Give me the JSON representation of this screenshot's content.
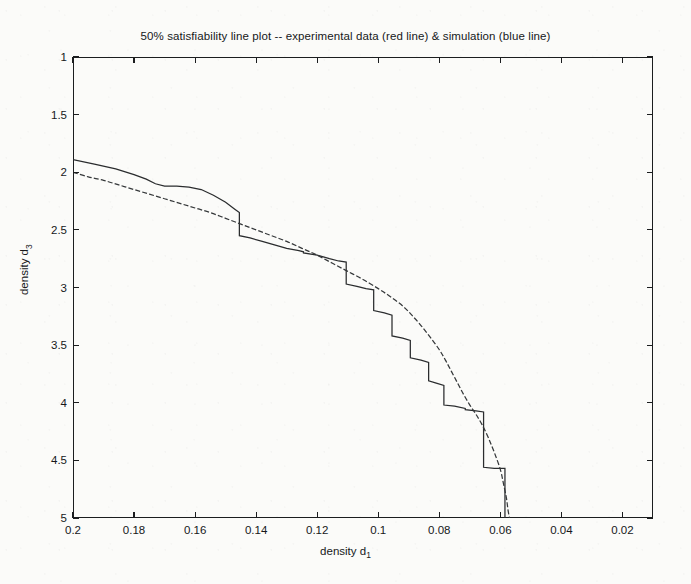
{
  "chart_data": {
    "type": "line",
    "title": "50% satisfiability line plot -- experimental data (red line) & simulation (blue line)",
    "xlabel": "density d",
    "xlabel_sub": "1",
    "ylabel": "density d",
    "ylabel_sub": "3",
    "xlim": [
      0.2,
      0.01
    ],
    "ylim": [
      5,
      1
    ],
    "x_inverted": true,
    "y_inverted": true,
    "grid": false,
    "legend_position": "none",
    "legend_in_title": true,
    "xticks": [
      0.2,
      0.18,
      0.16,
      0.14,
      0.12,
      0.1,
      0.08,
      0.06,
      0.04,
      0.02
    ],
    "xtick_labels": [
      "0.2",
      "0.18",
      "0.16",
      "0.14",
      "0.12",
      "0.1",
      "0.08",
      "0.06",
      "0.04",
      "0.02"
    ],
    "yticks": [
      1,
      1.5,
      2,
      2.5,
      3,
      3.5,
      4,
      4.5,
      5
    ],
    "ytick_labels": [
      "1",
      "1.5",
      "2",
      "2.5",
      "3",
      "3.5",
      "4",
      "4.5",
      "5"
    ],
    "series": [
      {
        "name": "experimental data (red line)",
        "style": "step",
        "color": "#2a2c2e",
        "points": [
          [
            0.2,
            1.89
          ],
          [
            0.193,
            1.93
          ],
          [
            0.186,
            1.97
          ],
          [
            0.18,
            2.02
          ],
          [
            0.176,
            2.06
          ],
          [
            0.173,
            2.1
          ],
          [
            0.17,
            2.12
          ],
          [
            0.166,
            2.12
          ],
          [
            0.162,
            2.13
          ],
          [
            0.158,
            2.15
          ],
          [
            0.154,
            2.2
          ],
          [
            0.15,
            2.26
          ],
          [
            0.147,
            2.32
          ],
          [
            0.1455,
            2.35
          ],
          [
            0.1455,
            2.55
          ],
          [
            0.142,
            2.57
          ],
          [
            0.138,
            2.6
          ],
          [
            0.134,
            2.63
          ],
          [
            0.13,
            2.66
          ],
          [
            0.126,
            2.68
          ],
          [
            0.1245,
            2.69
          ],
          [
            0.1245,
            2.7
          ],
          [
            0.12,
            2.72
          ],
          [
            0.116,
            2.75
          ],
          [
            0.113,
            2.77
          ],
          [
            0.1105,
            2.78
          ],
          [
            0.1105,
            2.97
          ],
          [
            0.107,
            2.99
          ],
          [
            0.104,
            3.01
          ],
          [
            0.1015,
            3.02
          ],
          [
            0.1015,
            3.2
          ],
          [
            0.098,
            3.22
          ],
          [
            0.0955,
            3.24
          ],
          [
            0.0955,
            3.42
          ],
          [
            0.092,
            3.44
          ],
          [
            0.0895,
            3.46
          ],
          [
            0.0895,
            3.61
          ],
          [
            0.086,
            3.63
          ],
          [
            0.0835,
            3.65
          ],
          [
            0.0835,
            3.81
          ],
          [
            0.081,
            3.83
          ],
          [
            0.0785,
            3.85
          ],
          [
            0.0785,
            4.02
          ],
          [
            0.075,
            4.03
          ],
          [
            0.0715,
            4.05
          ],
          [
            0.0715,
            4.06
          ],
          [
            0.068,
            4.07
          ],
          [
            0.0655,
            4.08
          ],
          [
            0.0655,
            4.56
          ],
          [
            0.062,
            4.57
          ],
          [
            0.0585,
            4.57
          ],
          [
            0.0585,
            5.0
          ]
        ]
      },
      {
        "name": "simulation (blue line)",
        "style": "smooth",
        "color": "#35383a",
        "points": [
          [
            0.2,
            2.0
          ],
          [
            0.195,
            2.04
          ],
          [
            0.19,
            2.07
          ],
          [
            0.185,
            2.11
          ],
          [
            0.18,
            2.15
          ],
          [
            0.175,
            2.19
          ],
          [
            0.17,
            2.23
          ],
          [
            0.165,
            2.27
          ],
          [
            0.16,
            2.31
          ],
          [
            0.155,
            2.35
          ],
          [
            0.15,
            2.4
          ],
          [
            0.145,
            2.45
          ],
          [
            0.14,
            2.5
          ],
          [
            0.135,
            2.55
          ],
          [
            0.13,
            2.6
          ],
          [
            0.125,
            2.66
          ],
          [
            0.12,
            2.72
          ],
          [
            0.115,
            2.79
          ],
          [
            0.11,
            2.86
          ],
          [
            0.105,
            2.93
          ],
          [
            0.1,
            3.01
          ],
          [
            0.096,
            3.08
          ],
          [
            0.092,
            3.16
          ],
          [
            0.089,
            3.24
          ],
          [
            0.086,
            3.33
          ],
          [
            0.083,
            3.43
          ],
          [
            0.08,
            3.54
          ],
          [
            0.078,
            3.63
          ],
          [
            0.076,
            3.73
          ],
          [
            0.074,
            3.83
          ],
          [
            0.072,
            3.93
          ],
          [
            0.07,
            4.02
          ],
          [
            0.068,
            4.1
          ],
          [
            0.066,
            4.19
          ],
          [
            0.064,
            4.3
          ],
          [
            0.062,
            4.43
          ],
          [
            0.06,
            4.58
          ],
          [
            0.059,
            4.7
          ],
          [
            0.058,
            4.83
          ],
          [
            0.0575,
            4.93
          ],
          [
            0.057,
            5.0
          ]
        ]
      }
    ]
  },
  "axes": {
    "plot_left_px": 73,
    "plot_top_px": 57,
    "plot_width_px": 580,
    "plot_height_px": 461
  }
}
